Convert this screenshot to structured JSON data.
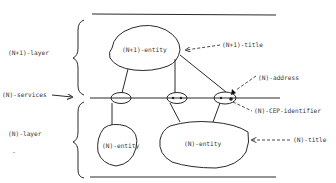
{
  "diagram": {
    "labels": {
      "n_plus_1_layer": "(N+1)-layer",
      "n_services": "(N)-services",
      "n_layer": "(N)-layer",
      "n_plus_1_entity": "(N+1)-entity",
      "n_plus_1_title": "(N+1)-title",
      "n_address": "(N)-address",
      "n_cep_identifier": "(N)-CEP-identifier",
      "n_entity_left": "(N)-entity",
      "n_entity_right": "(N)-entity",
      "n_title": "(N)-title",
      "dash_mark": "-"
    },
    "colors": {
      "line": "#2a2a2a",
      "background": "#ffffff",
      "text": "#3a3a3a"
    }
  }
}
